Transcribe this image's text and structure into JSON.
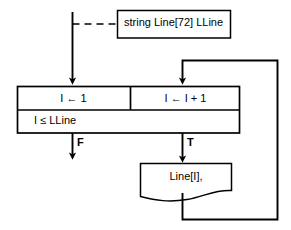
{
  "diagram": {
    "colors": {
      "stroke": "#000000",
      "background": "#ffffff",
      "text": "#000000"
    },
    "declaration": {
      "text": "string Line[72] LLine",
      "connector": "dashed-line"
    },
    "loop_box": {
      "init_text": "I ← 1",
      "increment_text": "I ← I + 1",
      "condition_text": "I ≤ LLine"
    },
    "branches": {
      "false_label": "F",
      "true_label": "T"
    },
    "output": {
      "text": "Line[I],",
      "shape": "document"
    },
    "arrows": {
      "entry": "entry-arrow",
      "false_exit": "false-exit-arrow",
      "true_exit": "true-exit-arrow",
      "loop_back": "loop-back-arrow"
    }
  }
}
